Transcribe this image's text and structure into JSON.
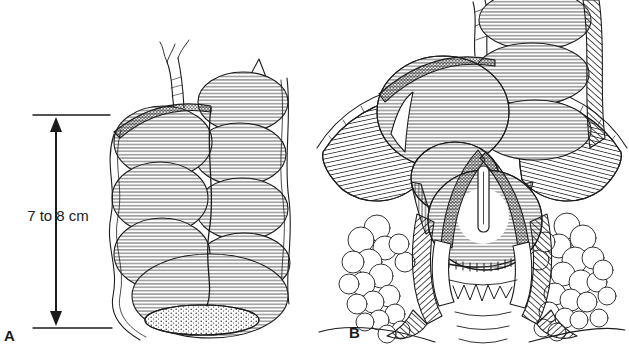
{
  "figure": {
    "kind": "medical-line-illustration",
    "background_color": "#ffffff",
    "ink_color": "#1c1c1c",
    "measurement": {
      "label": "7 to 8 cm"
    },
    "panels": [
      {
        "label": "A",
        "name": "colonic-pouch-length-view"
      },
      {
        "label": "B",
        "name": "pouch-in-pelvis-cutaway-view"
      }
    ]
  }
}
